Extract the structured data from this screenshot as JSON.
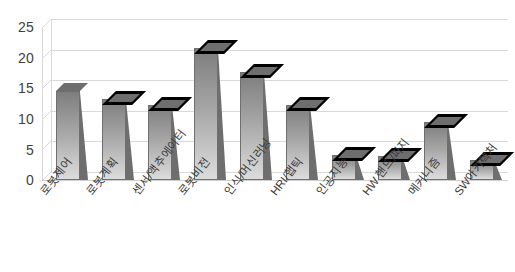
{
  "chart_data": {
    "type": "bar",
    "title": "",
    "subtitle": "",
    "xlabel": "",
    "ylabel": "",
    "ylim": [
      0,
      25
    ],
    "yticks": [
      0,
      5,
      10,
      15,
      20,
      25
    ],
    "ytick_labels": [
      "0",
      "5",
      "10",
      "15",
      "20",
      "25"
    ],
    "grid": true,
    "legend": false,
    "legend_position": "none",
    "style": "3d-column-grayscale",
    "categories": [
      "로봇제어",
      "로봇계획",
      "센서/액추에이터",
      "로봇비전",
      "인식/머신러닝",
      "HRI/햅틱",
      "인공지능",
      "HW 핸드/파지",
      "메커니즘",
      "SW아키텍처"
    ],
    "values": [
      14.5,
      13.2,
      12.3,
      21.5,
      17.6,
      12.3,
      4.1,
      4.0,
      9.4,
      3.3
    ],
    "series": [
      {
        "name": "",
        "values": [
          14.5,
          13.2,
          12.3,
          21.5,
          17.6,
          12.3,
          4.1,
          4.0,
          9.4,
          3.3
        ]
      }
    ],
    "colors": {
      "bar_top": "#7d7d7d",
      "bar_bottom": "#dcdcdc",
      "bar_border": "#6f6f6f",
      "bar_side": "#6e6e6e",
      "gridline": "#d9d9d9",
      "axis_text": "#3f3f3f",
      "background": "#ffffff"
    }
  }
}
